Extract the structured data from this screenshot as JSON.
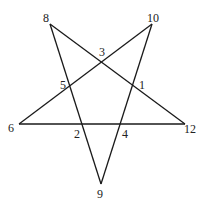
{
  "diagram": {
    "type": "pentagram",
    "stroke_color": "#1a1a1a",
    "background": "#ffffff",
    "outer_points": [
      {
        "label": "8",
        "x": 50,
        "y": 24,
        "lx": 43,
        "ly": 22
      },
      {
        "label": "10",
        "x": 152,
        "y": 24,
        "lx": 147,
        "ly": 22
      },
      {
        "label": "6",
        "x": 19,
        "y": 124,
        "lx": 8,
        "ly": 132
      },
      {
        "label": "12",
        "x": 185,
        "y": 124,
        "lx": 184,
        "ly": 133
      },
      {
        "label": "9",
        "x": 101,
        "y": 184,
        "lx": 97,
        "ly": 198
      }
    ],
    "inner_points": [
      {
        "label": "3",
        "x": 102,
        "y": 62,
        "lx": 99,
        "ly": 56
      },
      {
        "label": "5",
        "x": 70,
        "y": 87,
        "lx": 60,
        "ly": 89
      },
      {
        "label": "1",
        "x": 135,
        "y": 87,
        "lx": 139,
        "ly": 89
      },
      {
        "label": "2",
        "x": 83,
        "y": 124,
        "lx": 74,
        "ly": 138
      },
      {
        "label": "4",
        "x": 121,
        "y": 124,
        "lx": 122,
        "ly": 138
      }
    ],
    "edges": [
      {
        "from": "8",
        "to": "12"
      },
      {
        "from": "8",
        "to": "9"
      },
      {
        "from": "10",
        "to": "6"
      },
      {
        "from": "10",
        "to": "9"
      },
      {
        "from": "6",
        "to": "12"
      }
    ]
  }
}
